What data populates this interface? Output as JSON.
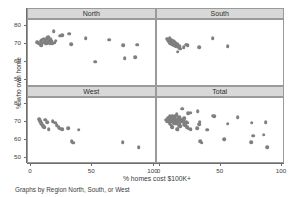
{
  "chart_data": {
    "type": "scatter",
    "title": "",
    "xlabel": "% homes cost $100K+",
    "ylabel": "% who own home",
    "note": "Graphs by Region North, South, or West",
    "xlim": [
      0,
      100
    ],
    "ylim": [
      48,
      82
    ],
    "xticks": [
      0,
      50,
      100
    ],
    "yticks": [
      50,
      60,
      70,
      80
    ],
    "xtick_labels": [
      "0",
      "50",
      "100"
    ],
    "ytick_labels": [
      "50",
      "60",
      "70",
      "80"
    ],
    "grid": false,
    "legend": "none",
    "marker_color": "#7f7f7f",
    "panel_header_color": "#d8d8d8",
    "panels": [
      {
        "label": "North",
        "row": 0,
        "col": 0,
        "points": [
          [
            5.0,
            71.2
          ],
          [
            6.5,
            70.3
          ],
          [
            7.8,
            71.8
          ],
          [
            8.4,
            69.6
          ],
          [
            9.2,
            72.6
          ],
          [
            9.8,
            70.8
          ],
          [
            10.5,
            73.0
          ],
          [
            11.1,
            71.4
          ],
          [
            11.9,
            72.2
          ],
          [
            12.4,
            70.2
          ],
          [
            13.0,
            73.4
          ],
          [
            13.6,
            71.0
          ],
          [
            14.2,
            74.0
          ],
          [
            14.9,
            72.0
          ],
          [
            15.4,
            70.6
          ],
          [
            16.2,
            72.8
          ],
          [
            16.8,
            71.6
          ],
          [
            17.4,
            70.4
          ],
          [
            18.6,
            77.2
          ],
          [
            19.3,
            70.9
          ],
          [
            20.1,
            71.9
          ],
          [
            23.6,
            74.8
          ],
          [
            25.4,
            75.0
          ],
          [
            31.2,
            75.8
          ],
          [
            32.8,
            69.9
          ],
          [
            44.6,
            73.2
          ],
          [
            52.6,
            60.3
          ],
          [
            63.8,
            72.6
          ],
          [
            75.4,
            69.4
          ],
          [
            76.6,
            62.2
          ],
          [
            85.0,
            62.8
          ],
          [
            86.8,
            69.7
          ]
        ]
      },
      {
        "label": "South",
        "row": 0,
        "col": 1,
        "points": [
          [
            6.4,
            73.0
          ],
          [
            7.1,
            72.2
          ],
          [
            7.9,
            71.4
          ],
          [
            8.3,
            73.4
          ],
          [
            8.9,
            70.7
          ],
          [
            9.4,
            72.6
          ],
          [
            10.0,
            71.8
          ],
          [
            10.6,
            70.0
          ],
          [
            11.2,
            72.0
          ],
          [
            11.8,
            69.3
          ],
          [
            12.4,
            71.1
          ],
          [
            13.0,
            70.4
          ],
          [
            13.6,
            68.8
          ],
          [
            14.4,
            70.0
          ],
          [
            15.6,
            68.2
          ],
          [
            16.4,
            69.0
          ],
          [
            17.0,
            67.6
          ],
          [
            14.8,
            65.8
          ],
          [
            19.6,
            68.4
          ],
          [
            21.6,
            69.7
          ],
          [
            23.0,
            69.4
          ],
          [
            32.6,
            68.5
          ],
          [
            43.4,
            73.4
          ],
          [
            55.6,
            68.8
          ]
        ]
      },
      {
        "label": "West",
        "row": 1,
        "col": 0,
        "points": [
          [
            6.8,
            71.4
          ],
          [
            7.6,
            70.2
          ],
          [
            8.2,
            69.2
          ],
          [
            9.0,
            68.4
          ],
          [
            9.8,
            67.6
          ],
          [
            10.6,
            66.9
          ],
          [
            11.8,
            71.0
          ],
          [
            13.4,
            69.6
          ],
          [
            14.6,
            66.0
          ],
          [
            17.6,
            70.2
          ],
          [
            19.6,
            69.4
          ],
          [
            21.0,
            68.0
          ],
          [
            22.6,
            67.0
          ],
          [
            24.0,
            66.2
          ],
          [
            25.4,
            66.0
          ],
          [
            30.6,
            66.4
          ],
          [
            33.2,
            59.2
          ],
          [
            34.6,
            58.4
          ],
          [
            38.8,
            65.6
          ],
          [
            74.8,
            58.8
          ],
          [
            87.8,
            56.0
          ]
        ]
      },
      {
        "label": "Total",
        "row": 1,
        "col": 1,
        "points": [
          [
            5.0,
            71.2
          ],
          [
            6.4,
            70.3
          ],
          [
            6.8,
            71.4
          ],
          [
            7.1,
            72.2
          ],
          [
            7.6,
            70.2
          ],
          [
            7.8,
            71.8
          ],
          [
            7.9,
            71.4
          ],
          [
            8.2,
            69.2
          ],
          [
            8.3,
            73.4
          ],
          [
            8.4,
            69.6
          ],
          [
            8.9,
            70.7
          ],
          [
            9.0,
            68.4
          ],
          [
            9.2,
            72.6
          ],
          [
            9.4,
            72.6
          ],
          [
            9.8,
            70.8
          ],
          [
            9.8,
            67.6
          ],
          [
            10.0,
            71.8
          ],
          [
            10.5,
            73.0
          ],
          [
            10.6,
            70.0
          ],
          [
            10.6,
            66.9
          ],
          [
            11.1,
            71.4
          ],
          [
            11.2,
            72.0
          ],
          [
            11.8,
            72.2
          ],
          [
            11.8,
            69.3
          ],
          [
            11.8,
            71.0
          ],
          [
            12.4,
            70.2
          ],
          [
            12.4,
            71.1
          ],
          [
            13.0,
            73.4
          ],
          [
            13.0,
            70.4
          ],
          [
            13.4,
            69.6
          ],
          [
            13.6,
            71.0
          ],
          [
            13.6,
            68.8
          ],
          [
            14.2,
            74.0
          ],
          [
            14.4,
            70.0
          ],
          [
            14.6,
            66.0
          ],
          [
            14.8,
            65.8
          ],
          [
            14.9,
            72.0
          ],
          [
            15.4,
            70.6
          ],
          [
            15.6,
            68.2
          ],
          [
            16.2,
            72.8
          ],
          [
            16.4,
            69.0
          ],
          [
            16.8,
            71.6
          ],
          [
            17.0,
            67.6
          ],
          [
            17.4,
            70.4
          ],
          [
            17.6,
            70.2
          ],
          [
            18.6,
            77.2
          ],
          [
            19.3,
            70.9
          ],
          [
            19.6,
            68.4
          ],
          [
            19.6,
            69.4
          ],
          [
            20.1,
            71.9
          ],
          [
            21.0,
            68.0
          ],
          [
            21.6,
            69.7
          ],
          [
            22.6,
            67.0
          ],
          [
            23.0,
            69.4
          ],
          [
            23.6,
            74.8
          ],
          [
            24.0,
            66.2
          ],
          [
            25.4,
            75.0
          ],
          [
            25.4,
            66.0
          ],
          [
            30.6,
            66.4
          ],
          [
            31.2,
            75.8
          ],
          [
            32.6,
            68.5
          ],
          [
            32.8,
            69.9
          ],
          [
            33.2,
            59.2
          ],
          [
            34.6,
            58.4
          ],
          [
            38.8,
            65.6
          ],
          [
            43.4,
            73.4
          ],
          [
            44.6,
            73.2
          ],
          [
            52.6,
            60.3
          ],
          [
            55.6,
            68.8
          ],
          [
            63.8,
            72.6
          ],
          [
            74.8,
            58.8
          ],
          [
            75.4,
            69.4
          ],
          [
            76.6,
            62.2
          ],
          [
            85.0,
            62.8
          ],
          [
            86.8,
            69.7
          ],
          [
            87.8,
            56.0
          ]
        ]
      }
    ]
  }
}
